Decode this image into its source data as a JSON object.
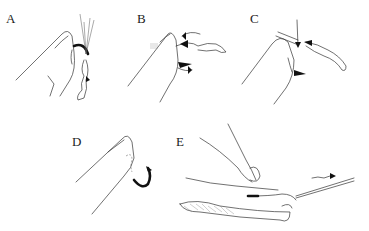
{
  "figure": {
    "panels": [
      {
        "id": "A",
        "label": "A",
        "description": "finger pressing fly hook shank, hook embedded"
      },
      {
        "id": "B",
        "label": "B",
        "description": "line looped around hook bend with directional arrows"
      },
      {
        "id": "C",
        "label": "C",
        "description": "downward arrow pressing hook shank"
      },
      {
        "id": "D",
        "label": "D",
        "description": "hook backed out of fingertip"
      },
      {
        "id": "E",
        "label": "E",
        "description": "string-yank technique with line pulled in direction of arrow"
      }
    ],
    "colors": {
      "ink": "#222222",
      "background": "#ffffff"
    }
  }
}
